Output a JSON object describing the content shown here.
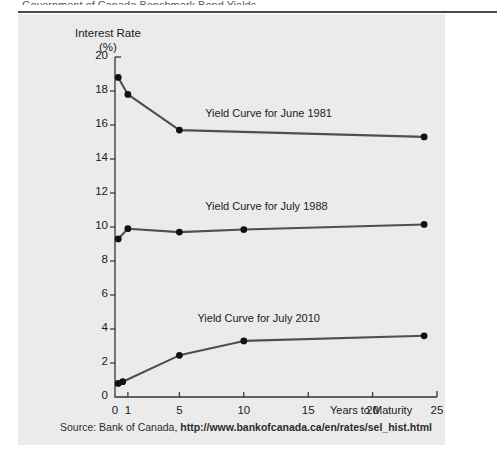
{
  "figure": {
    "header_fragment": "Government of Canada Benchmark Bond Yields",
    "source_prefix": "Source: Bank of Canada,",
    "source_url": "http://www.bankofcanada.ca/en/rates/sel_hist.html"
  },
  "chart_data": {
    "type": "line",
    "title": "",
    "xlabel": "Years to Maturity",
    "ylabel": "Interest Rate",
    "ylabel_unit": "(%)",
    "xlim": [
      0,
      25
    ],
    "ylim": [
      0,
      20
    ],
    "xticks": [
      0,
      1,
      5,
      10,
      15,
      20,
      25
    ],
    "yticks": [
      0,
      2,
      4,
      6,
      8,
      10,
      12,
      14,
      16,
      18,
      20
    ],
    "xtick_labels": [
      "0",
      "1",
      "5",
      "10",
      "15",
      "20",
      "25"
    ],
    "ytick_labels": [
      "0",
      "2",
      "4",
      "6",
      "8",
      "10",
      "12",
      "14",
      "16",
      "18",
      "20"
    ],
    "grid": false,
    "legend": "inline-annotations",
    "line_color": "#4f4f4f",
    "marker_color": "#111111",
    "series": [
      {
        "name": "Yield Curve for June 1981",
        "label": "Yield Curve for June 1981",
        "x": [
          0.25,
          1,
          5,
          24
        ],
        "values": [
          18.8,
          17.8,
          15.7,
          15.3
        ]
      },
      {
        "name": "Yield Curve for July 1988",
        "label": "Yield Curve for July 1988",
        "x": [
          0.25,
          1,
          5,
          10,
          24
        ],
        "values": [
          9.3,
          9.9,
          9.7,
          9.85,
          10.15
        ]
      },
      {
        "name": "Yield Curve for July 2010",
        "label": "Yield Curve for July 2010",
        "x": [
          0.25,
          0.6,
          5,
          10,
          24
        ],
        "values": [
          0.8,
          0.9,
          2.45,
          3.3,
          3.6
        ]
      }
    ],
    "annotations": [
      {
        "text": "Yield Curve for June 1981",
        "x": 7.0,
        "y": 16.6
      },
      {
        "text": "Yield Curve for July 1988",
        "x": 7.0,
        "y": 11.1
      },
      {
        "text": "Yield Curve for July 2010",
        "x": 6.4,
        "y": 4.55
      }
    ]
  }
}
